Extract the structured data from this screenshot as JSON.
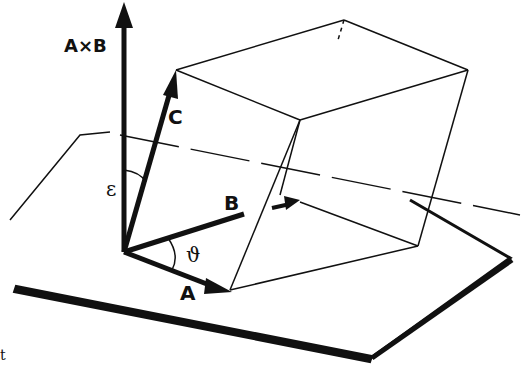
{
  "diagram": {
    "labels": {
      "cross": "A×B",
      "a": "A",
      "b": "B",
      "c": "C",
      "epsilon": "ε",
      "theta": "ϑ",
      "corner_mark": "t"
    },
    "ink_color": "#111111",
    "background_color": "#ffffff"
  }
}
